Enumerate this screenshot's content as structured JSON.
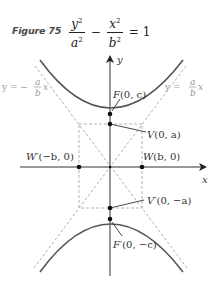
{
  "figure": {
    "number_label": "Figure 75",
    "equation": {
      "term1": {
        "numerator": "y",
        "num_exp": "2",
        "denominator": "a",
        "den_exp": "2"
      },
      "operator": "−",
      "term2": {
        "numerator": "x",
        "num_exp": "2",
        "denominator": "b",
        "den_exp": "2"
      },
      "equals": "= 1"
    }
  },
  "diagram": {
    "axes": {
      "x_label": "x",
      "y_label": "y"
    },
    "points": {
      "focus_top": {
        "name": "F",
        "coords": "(0, c)"
      },
      "vertex_top": {
        "name": "V",
        "coords": "(0, a)"
      },
      "co_vertex_right": {
        "name": "W",
        "coords": "(b, 0)"
      },
      "co_vertex_left": {
        "name": "W′",
        "coords": "(−b, 0)"
      },
      "vertex_bottom": {
        "name": "V′",
        "coords": "(0, −a)"
      },
      "focus_bottom": {
        "name": "F′",
        "coords": "(0, −c)"
      }
    },
    "asymptotes": {
      "left": {
        "prefix": "y = −",
        "num": "a",
        "den": "b",
        "suffix": "x"
      },
      "right": {
        "prefix": "y = ",
        "num": "a",
        "den": "b",
        "suffix": "x"
      }
    },
    "colors": {
      "curve": "#555555",
      "axis": "#333333",
      "dashed": "#aaaaaa",
      "point": "#111111",
      "label": "#333333",
      "asymptote_label": "#999999"
    }
  }
}
